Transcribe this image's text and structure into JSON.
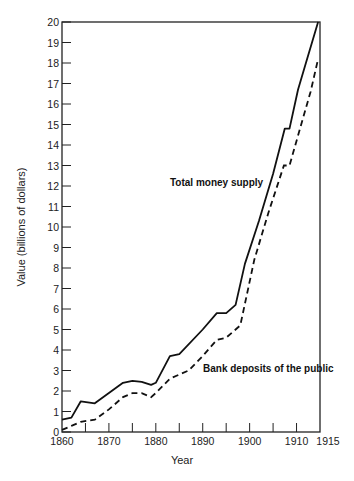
{
  "chart_data": {
    "type": "line",
    "title": "",
    "xlabel": "Year",
    "ylabel": "Value (billions of dollars)",
    "xlim": [
      1860,
      1915
    ],
    "ylim": [
      0,
      20
    ],
    "x_ticks": [
      1860,
      1870,
      1880,
      1890,
      1900,
      1910,
      1915
    ],
    "x_minor_ticks": [
      1865,
      1875,
      1885,
      1895,
      1905
    ],
    "y_ticks": [
      0,
      1,
      2,
      3,
      4,
      5,
      6,
      7,
      8,
      9,
      10,
      11,
      12,
      13,
      14,
      15,
      16,
      17,
      18,
      19,
      20
    ],
    "grid": false,
    "legend": "inline annotations",
    "annotations": [
      {
        "text": "Total money supply",
        "x": 1884.5,
        "y": 11.7
      },
      {
        "text": "Bank deposits of the public",
        "x": 1886.5,
        "y": 4.1
      }
    ],
    "series": [
      {
        "name": "Total money supply",
        "style": "solid",
        "x": [
          1860,
          1862,
          1864,
          1867,
          1870,
          1873,
          1875,
          1877,
          1879,
          1880,
          1883,
          1885,
          1890,
          1893,
          1895,
          1897,
          1899,
          1902,
          1905,
          1907.5,
          1908.5,
          1910.3,
          1912,
          1914.6
        ],
        "values": [
          0.6,
          0.7,
          1.5,
          1.4,
          1.9,
          2.4,
          2.5,
          2.45,
          2.3,
          2.4,
          3.7,
          3.8,
          5.0,
          5.8,
          5.8,
          6.2,
          8.2,
          10.3,
          12.6,
          14.8,
          14.8,
          16.7,
          18.0,
          20.0
        ]
      },
      {
        "name": "Bank deposits of the public",
        "style": "dashed",
        "x": [
          1860,
          1862,
          1864,
          1867,
          1870,
          1873,
          1875,
          1877,
          1879,
          1880,
          1883,
          1887,
          1890,
          1893,
          1895,
          1898,
          1901,
          1904,
          1907.3,
          1908.5,
          1911,
          1913,
          1914.6
        ],
        "values": [
          0.1,
          0.3,
          0.5,
          0.6,
          1.1,
          1.7,
          1.9,
          1.9,
          1.7,
          1.9,
          2.6,
          3.0,
          3.7,
          4.5,
          4.6,
          5.2,
          8.4,
          10.7,
          13.0,
          13.0,
          15.0,
          16.6,
          18.2
        ]
      }
    ]
  }
}
